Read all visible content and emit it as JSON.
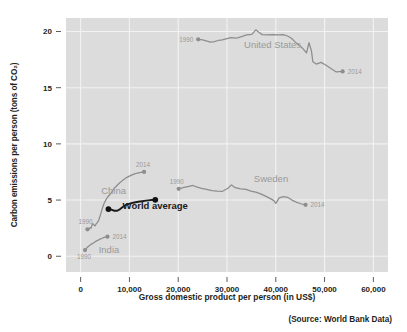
{
  "chart_data": {
    "type": "line",
    "title": "",
    "xlabel": "Gross domestic product per person (in US$)",
    "ylabel": "Carbon emissions per person (tons of CO₂)",
    "source_note": "(Source: World Bank Data)",
    "xlim": [
      -3000,
      63000
    ],
    "ylim": [
      -1.4,
      21.2
    ],
    "xticks": [
      0,
      10000,
      20000,
      30000,
      40000,
      50000,
      60000
    ],
    "xticklabels": [
      "0",
      "10,000",
      "20,000",
      "30,000",
      "40,000",
      "50,000",
      "60,000"
    ],
    "yticks": [
      0,
      5,
      10,
      15,
      20
    ],
    "yticklabels": [
      "0",
      "5",
      "10",
      "15",
      "20"
    ],
    "grid": true,
    "grid_color": "#f2f2f2",
    "plot_background": "#dcdcdc",
    "legend": "inline-annotations",
    "series": [
      {
        "name": "United States",
        "color": "#8d8d8d",
        "label_x": 33500,
        "label_y": 18.5,
        "start_label": "1990",
        "end_label": "2014",
        "points": [
          [
            24100,
            19.3
          ],
          [
            25000,
            19.25
          ],
          [
            25900,
            19.15
          ],
          [
            26600,
            19.05
          ],
          [
            27400,
            19.1
          ],
          [
            28200,
            19.2
          ],
          [
            29000,
            19.25
          ],
          [
            29800,
            19.35
          ],
          [
            30800,
            19.45
          ],
          [
            31900,
            19.4
          ],
          [
            33000,
            19.55
          ],
          [
            34000,
            19.7
          ],
          [
            35100,
            19.75
          ],
          [
            35900,
            20.15
          ],
          [
            36600,
            19.9
          ],
          [
            37200,
            19.72
          ],
          [
            38300,
            19.7
          ],
          [
            39400,
            19.72
          ],
          [
            40500,
            19.7
          ],
          [
            41500,
            19.72
          ],
          [
            42400,
            19.6
          ],
          [
            43200,
            19.4
          ],
          [
            44000,
            19.05
          ],
          [
            44900,
            18.75
          ],
          [
            45600,
            18.45
          ],
          [
            46300,
            18.1
          ],
          [
            46800,
            19.0
          ],
          [
            47300,
            18.3
          ],
          [
            47600,
            17.3
          ],
          [
            48300,
            17.1
          ],
          [
            49300,
            17.25
          ],
          [
            50300,
            17.0
          ],
          [
            51300,
            16.7
          ],
          [
            52400,
            16.4
          ],
          [
            53700,
            16.45
          ]
        ]
      },
      {
        "name": "Sweden",
        "color": "#8d8d8d",
        "label_x": 35500,
        "label_y": 6.6,
        "start_label": "1990",
        "end_label": "2014",
        "points": [
          [
            20100,
            6.0
          ],
          [
            21200,
            6.12
          ],
          [
            22200,
            6.22
          ],
          [
            23000,
            6.3
          ],
          [
            23900,
            6.15
          ],
          [
            24800,
            6.05
          ],
          [
            25800,
            5.95
          ],
          [
            26900,
            5.85
          ],
          [
            28000,
            5.8
          ],
          [
            29100,
            5.78
          ],
          [
            30200,
            6.05
          ],
          [
            30900,
            6.35
          ],
          [
            31700,
            6.1
          ],
          [
            32800,
            6.0
          ],
          [
            33900,
            5.95
          ],
          [
            34900,
            5.8
          ],
          [
            35900,
            5.7
          ],
          [
            36900,
            5.55
          ],
          [
            37900,
            5.35
          ],
          [
            38800,
            5.15
          ],
          [
            39600,
            4.95
          ],
          [
            40000,
            4.7
          ],
          [
            40700,
            5.2
          ],
          [
            41600,
            5.3
          ],
          [
            42400,
            5.25
          ],
          [
            43300,
            5.0
          ],
          [
            44300,
            4.8
          ],
          [
            45300,
            4.65
          ],
          [
            46100,
            4.58
          ]
        ]
      },
      {
        "name": "China",
        "color": "#8d8d8d",
        "label_x": 4200,
        "label_y": 5.5,
        "start_label": "1990",
        "end_label": "2014",
        "points": [
          [
            1400,
            2.4
          ],
          [
            1550,
            2.3
          ],
          [
            1700,
            2.45
          ],
          [
            1900,
            2.55
          ],
          [
            2150,
            2.5
          ],
          [
            2300,
            2.75
          ],
          [
            2500,
            2.9
          ],
          [
            2700,
            2.8
          ],
          [
            2950,
            2.7
          ],
          [
            3150,
            2.85
          ],
          [
            3400,
            3.0
          ],
          [
            3700,
            3.2
          ],
          [
            4000,
            3.6
          ],
          [
            4400,
            4.2
          ],
          [
            4900,
            4.8
          ],
          [
            5500,
            5.25
          ],
          [
            6200,
            5.6
          ],
          [
            7000,
            6.1
          ],
          [
            7800,
            6.45
          ],
          [
            8600,
            6.75
          ],
          [
            9400,
            7.0
          ],
          [
            10300,
            7.2
          ],
          [
            11200,
            7.35
          ],
          [
            12100,
            7.45
          ],
          [
            13000,
            7.5
          ]
        ]
      },
      {
        "name": "India",
        "color": "#8d8d8d",
        "label_x": 3700,
        "label_y": 0.25,
        "start_label": "1990",
        "end_label": "2014",
        "points": [
          [
            900,
            0.55
          ],
          [
            1000,
            0.6
          ],
          [
            1100,
            0.65
          ],
          [
            1200,
            0.72
          ],
          [
            1350,
            0.78
          ],
          [
            1500,
            0.85
          ],
          [
            1650,
            0.9
          ],
          [
            1800,
            0.95
          ],
          [
            1950,
            1.0
          ],
          [
            2100,
            1.05
          ],
          [
            2300,
            1.1
          ],
          [
            2500,
            1.15
          ],
          [
            2700,
            1.2
          ],
          [
            2950,
            1.28
          ],
          [
            3200,
            1.35
          ],
          [
            3500,
            1.42
          ],
          [
            3800,
            1.48
          ],
          [
            4100,
            1.55
          ],
          [
            4400,
            1.6
          ],
          [
            4700,
            1.66
          ],
          [
            5000,
            1.7
          ],
          [
            5300,
            1.72
          ],
          [
            5500,
            1.74
          ]
        ]
      },
      {
        "name": "World average",
        "color": "#111111",
        "label_x": 8600,
        "label_y": 4.2,
        "start_label": "",
        "end_label": "",
        "points": [
          [
            5700,
            4.2
          ],
          [
            6300,
            4.15
          ],
          [
            6900,
            4.05
          ],
          [
            7500,
            4.05
          ],
          [
            8100,
            4.2
          ],
          [
            8700,
            4.4
          ],
          [
            9400,
            4.6
          ],
          [
            10200,
            4.7
          ],
          [
            11000,
            4.78
          ],
          [
            11800,
            4.85
          ],
          [
            12600,
            4.9
          ],
          [
            13400,
            4.95
          ],
          [
            14300,
            5.0
          ],
          [
            15300,
            5.02
          ]
        ]
      }
    ],
    "markers": [
      {
        "series": "United States",
        "label": "1990",
        "x": 24100,
        "y": 19.3,
        "label_side": "left",
        "style": "grey"
      },
      {
        "series": "United States",
        "label": "2014",
        "x": 53700,
        "y": 16.45,
        "label_side": "right",
        "style": "grey"
      },
      {
        "series": "Sweden",
        "label": "1990",
        "x": 20100,
        "y": 6.0,
        "label_side": "above-left",
        "style": "grey"
      },
      {
        "series": "Sweden",
        "label": "2014",
        "x": 46100,
        "y": 4.58,
        "label_side": "right",
        "style": "grey"
      },
      {
        "series": "China",
        "label": "1990",
        "x": 1400,
        "y": 2.4,
        "label_side": "above-left",
        "style": "grey"
      },
      {
        "series": "China",
        "label": "2014",
        "x": 13000,
        "y": 7.5,
        "label_side": "above",
        "style": "grey"
      },
      {
        "series": "India",
        "label": "1990",
        "x": 900,
        "y": 0.55,
        "label_side": "below-left",
        "style": "grey"
      },
      {
        "series": "India",
        "label": "2014",
        "x": 5500,
        "y": 1.74,
        "label_side": "right",
        "style": "grey"
      },
      {
        "series": "World average",
        "label": "",
        "x": 5700,
        "y": 4.2,
        "label_side": "none",
        "style": "dark"
      },
      {
        "series": "World average",
        "label": "",
        "x": 15300,
        "y": 5.02,
        "label_side": "none",
        "style": "dark"
      }
    ]
  }
}
